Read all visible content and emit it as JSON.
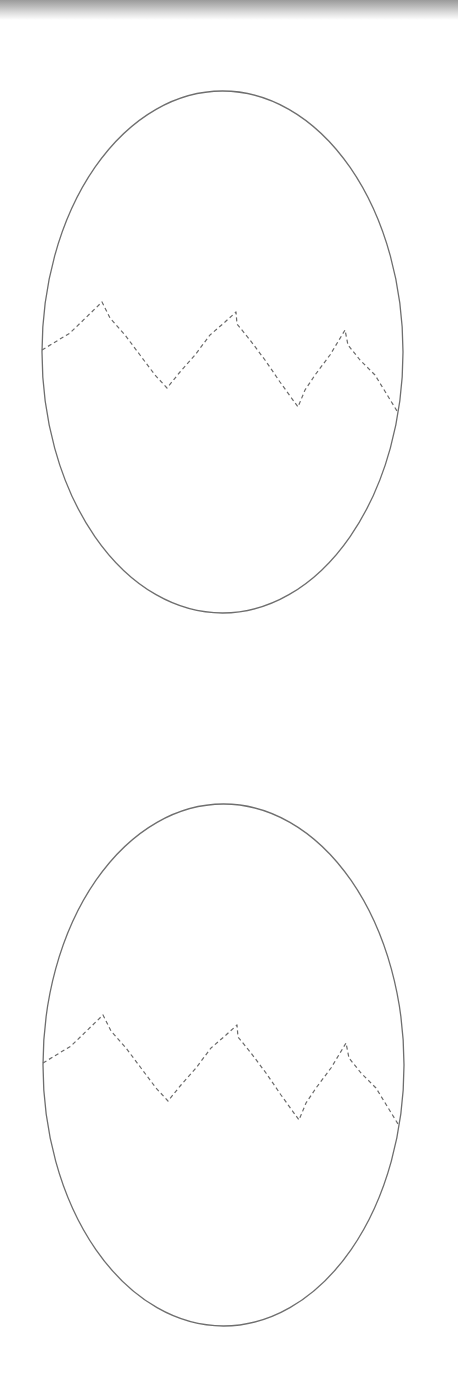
{
  "page": {
    "background": "#ffffff",
    "top_bar": {
      "gradient_top": "#9a9a9a",
      "gradient_bottom": "#ffffff",
      "height": 20
    }
  },
  "style": {
    "outline_color": "#6e6e6e",
    "outline_width": 1.3,
    "crack_color": "#6a6a6a",
    "crack_width": 1.2,
    "crack_dash": "4 3"
  },
  "eggs": [
    {
      "name": "egg-top",
      "cx": 222.5,
      "cy": 352,
      "rx": 180.5,
      "ry": 261,
      "crack_points": "42,350 70,333 102,302 110,318 125,335 140,355 155,375 167,388 180,372 195,355 210,335 225,322 236,312 237,324 250,340 265,360 280,382 298,407 305,390 315,375 330,355 345,330 348,345 360,360 375,375 397,411"
    },
    {
      "name": "egg-bottom",
      "cx": 223.5,
      "cy": 1065,
      "rx": 180.5,
      "ry": 261,
      "crack_points": "43,1063 71,1046 103,1015 111,1031 126,1048 141,1068 156,1088 168,1101 181,1085 196,1068 211,1048 226,1035 237,1025 238,1037 251,1053 266,1073 281,1095 299,1120 306,1103 316,1088 331,1068 346,1043 349,1058 361,1073 376,1088 398,1124"
    }
  ]
}
